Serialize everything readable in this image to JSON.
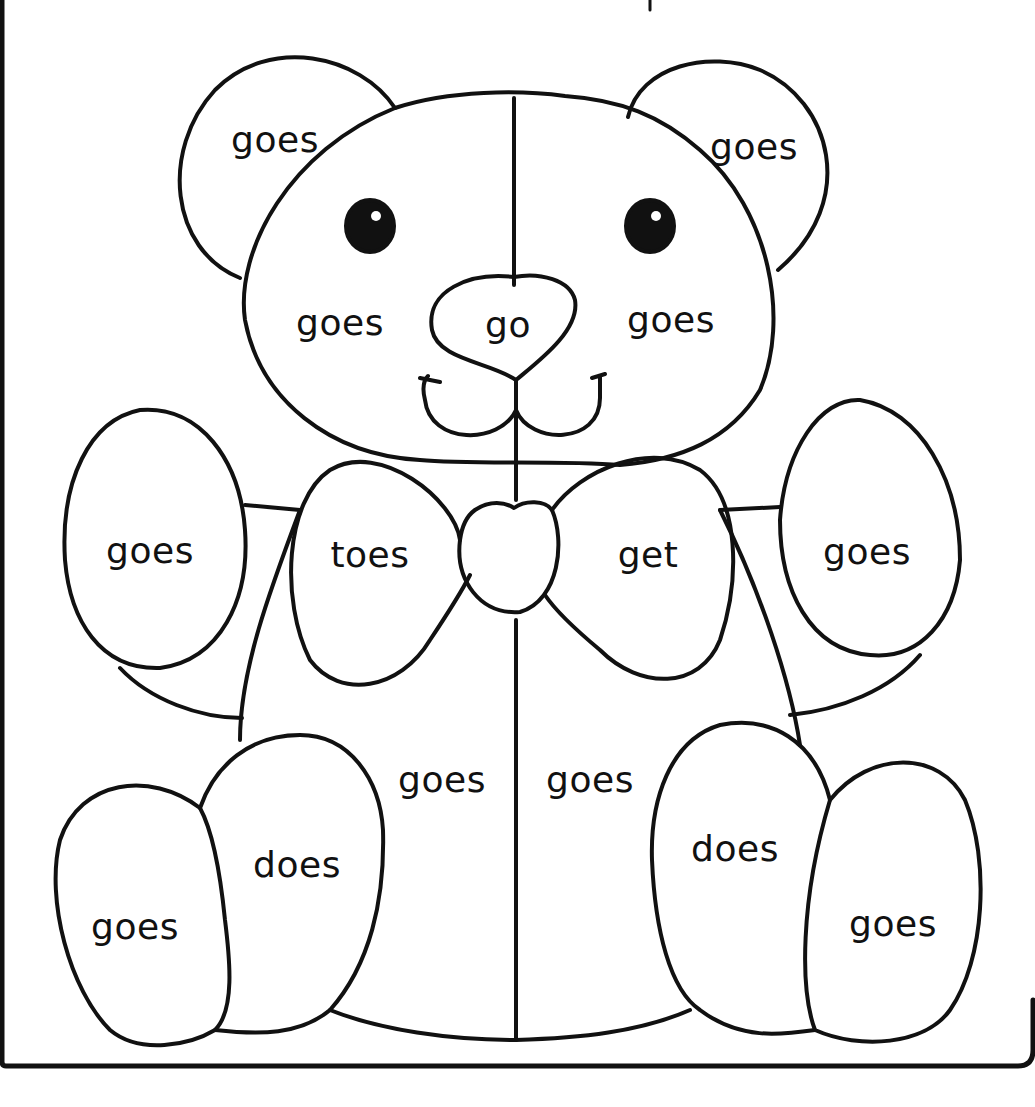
{
  "worksheet": {
    "type": "color-by-word coloring page",
    "subject": "teddy bear",
    "line_color": "#111111",
    "background_color": "#ffffff"
  },
  "regions": [
    {
      "id": "left-ear",
      "word": "goes",
      "x": 275,
      "y": 140
    },
    {
      "id": "right-ear",
      "word": "goes",
      "x": 754,
      "y": 147
    },
    {
      "id": "head-left",
      "word": "goes",
      "x": 340,
      "y": 323
    },
    {
      "id": "nose",
      "word": "go",
      "x": 508,
      "y": 325
    },
    {
      "id": "head-right",
      "word": "goes",
      "x": 671,
      "y": 320
    },
    {
      "id": "left-arm",
      "word": "goes",
      "x": 150,
      "y": 551
    },
    {
      "id": "bow-left",
      "word": "toes",
      "x": 370,
      "y": 555
    },
    {
      "id": "bow-right",
      "word": "get",
      "x": 648,
      "y": 555
    },
    {
      "id": "right-arm",
      "word": "goes",
      "x": 867,
      "y": 552
    },
    {
      "id": "body-left",
      "word": "goes",
      "x": 442,
      "y": 780
    },
    {
      "id": "body-right",
      "word": "goes",
      "x": 590,
      "y": 780
    },
    {
      "id": "left-leg",
      "word": "does",
      "x": 297,
      "y": 865
    },
    {
      "id": "right-leg",
      "word": "does",
      "x": 735,
      "y": 849
    },
    {
      "id": "left-foot",
      "word": "goes",
      "x": 135,
      "y": 927
    },
    {
      "id": "right-foot",
      "word": "goes",
      "x": 893,
      "y": 924
    }
  ]
}
